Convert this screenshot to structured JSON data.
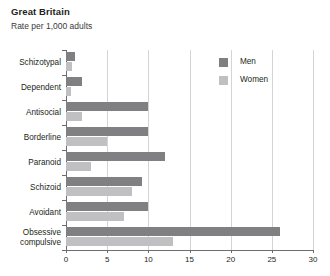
{
  "chart_data": {
    "type": "bar",
    "orientation": "horizontal",
    "title": "Great Britain",
    "subtitle": "Rate per 1,000 adults",
    "xlabel": "",
    "ylabel": "",
    "xlim": [
      0,
      30
    ],
    "xticks": [
      0,
      5,
      10,
      15,
      20,
      25,
      30
    ],
    "xtick_labels": [
      "0",
      "5",
      "10",
      "15",
      "20",
      "25",
      "30"
    ],
    "grid": "vertical",
    "legend_position": "top-right",
    "categories": [
      "Schizotypal",
      "Dependent",
      "Antisocial",
      "Borderline",
      "Paranoid",
      "Schizoid",
      "Avoidant",
      "Obsessive compulsive"
    ],
    "series": [
      {
        "name": "Men",
        "color": "#808083",
        "values": [
          1.1,
          2.0,
          10.0,
          10.0,
          12.0,
          9.2,
          10.0,
          26.0
        ]
      },
      {
        "name": "Women",
        "color": "#c0c0c2",
        "values": [
          0.7,
          0.6,
          2.0,
          5.0,
          3.0,
          8.0,
          7.0,
          13.0
        ]
      }
    ]
  },
  "axis": {
    "line_color": "#6d6d6d",
    "grid_color": "#d4d4d4"
  }
}
